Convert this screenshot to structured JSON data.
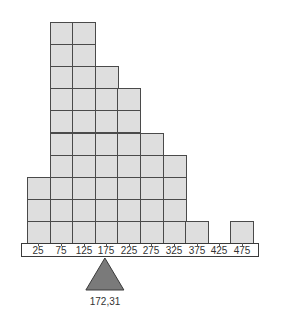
{
  "chart_data": {
    "type": "bar",
    "title": "",
    "xlabel": "",
    "ylabel": "",
    "categories": [
      "25",
      "75",
      "125",
      "175",
      "225",
      "275",
      "325",
      "375",
      "425",
      "475"
    ],
    "values": [
      3,
      10,
      10,
      8,
      7,
      5,
      4,
      1,
      0,
      1
    ],
    "ylim": [
      0,
      10
    ],
    "grid": false,
    "legend": null,
    "annotations": [
      {
        "type": "fulcrum-triangle",
        "x": 172.31,
        "label": "172,31"
      }
    ],
    "style": {
      "block_fill": "#dedede",
      "block_border": "#4a4a4a",
      "fulcrum_fill": "#7a7a7a"
    }
  },
  "balance": {
    "label": "172,31",
    "value": 172.31
  }
}
